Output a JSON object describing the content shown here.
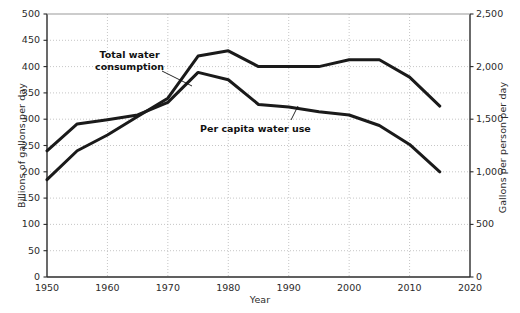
{
  "chart_data": {
    "type": "line",
    "title": "",
    "xlabel": "Year",
    "ylabel": "Billions of gallons per day",
    "y2label": "Gallons per person per day",
    "xlim": [
      1950,
      2020
    ],
    "ylim": [
      0,
      500
    ],
    "y2lim": [
      0,
      2500
    ],
    "xticks": [
      "1950",
      "1960",
      "1970",
      "1980",
      "1990",
      "2000",
      "2010",
      "2020"
    ],
    "xtick_values": [
      1950,
      1960,
      1970,
      1980,
      1990,
      2000,
      2010,
      2020
    ],
    "yticks": [
      "0",
      "50",
      "100",
      "150",
      "200",
      "250",
      "300",
      "350",
      "400",
      "450",
      "500"
    ],
    "ytick_values": [
      0,
      50,
      100,
      150,
      200,
      250,
      300,
      350,
      400,
      450,
      500
    ],
    "y2ticks": [
      "0",
      "500",
      "1,000",
      "1,500",
      "2,000",
      "2,500"
    ],
    "y2tick_values": [
      0,
      500,
      1000,
      1500,
      2000,
      2500
    ],
    "grid": true,
    "legend": "annotations-inline",
    "line_color": "#1a1a1a",
    "grid_color": "#b8b8b8",
    "axis_color": "#2b2b2b",
    "series": [
      {
        "name": "Total water consumption",
        "axis": "left",
        "units": "Billions of gallons per day",
        "x": [
          1950,
          1955,
          1960,
          1965,
          1970,
          1975,
          1980,
          1985,
          1990,
          1995,
          2000,
          2005,
          2010,
          2015
        ],
        "values": [
          185,
          240,
          270,
          305,
          340,
          420,
          430,
          400,
          400,
          400,
          413,
          413,
          380,
          325
        ]
      },
      {
        "name": "Per capita water use",
        "axis": "right",
        "units": "Gallons per person per day",
        "x": [
          1950,
          1955,
          1960,
          1965,
          1970,
          1975,
          1980,
          1985,
          1990,
          1995,
          2000,
          2005,
          2010,
          2015
        ],
        "values": [
          1200,
          1455,
          1495,
          1540,
          1660,
          1945,
          1875,
          1640,
          1615,
          1570,
          1540,
          1440,
          1260,
          1000
        ]
      }
    ],
    "annotations": [
      {
        "text_line1": "Total water",
        "text_line2": "consumption",
        "target_series": "Total water consumption"
      },
      {
        "text_line1": "Per capita water use",
        "text_line2": "",
        "target_series": "Per capita water use"
      }
    ]
  }
}
